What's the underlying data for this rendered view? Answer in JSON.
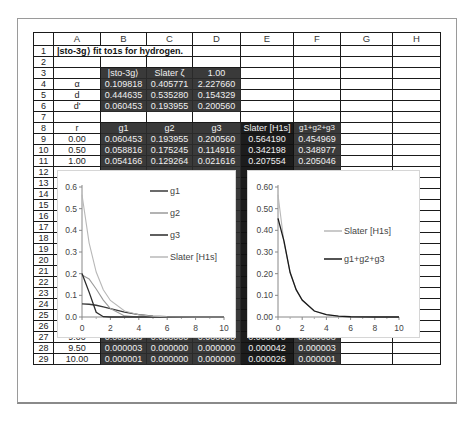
{
  "sheet": {
    "columns": [
      "A",
      "B",
      "C",
      "D",
      "E",
      "F",
      "G",
      "H"
    ],
    "title": "|sto-3g⟩ fit to1s for hydrogen.",
    "params_header": {
      "b": "|sto-3g⟩",
      "c": "Slater ζ",
      "d": "1.00"
    },
    "params": [
      {
        "label": "α",
        "b": "0.109818",
        "c": "0.405771",
        "d": "2.227660"
      },
      {
        "label": "d",
        "b": "0.444635",
        "c": "0.535280",
        "d": "0.154329"
      },
      {
        "label": "d'",
        "b": "0.060453",
        "c": "0.193955",
        "d": "0.200560"
      }
    ],
    "data_header": {
      "a": "r",
      "b": "g1",
      "c": "g2",
      "d": "g3",
      "e": "Slater [H1s]",
      "f": "g1+g2+g3"
    },
    "data_rows": [
      {
        "row": "9",
        "r": "0.00",
        "g1": "0.060453",
        "g2": "0.193955",
        "g3": "0.200560",
        "slater": "0.564190",
        "sum": "0.454969"
      },
      {
        "row": "10",
        "r": "0.50",
        "g1": "0.058816",
        "g2": "0.175245",
        "g3": "0.114916",
        "slater": "0.342198",
        "sum": "0.348977"
      },
      {
        "row": "11",
        "r": "1.00",
        "g1": "0.054166",
        "g2": "0.129264",
        "g3": "0.021616",
        "slater": "0.207554",
        "sum": "0.205046"
      },
      {
        "row": "25",
        "r": "8.00",
        "g1": "0.000054",
        "g2": "0.000000",
        "g3": "0.000000",
        "slater": "0.000189",
        "sum": "0.000054"
      },
      {
        "row": "26",
        "r": "8.50",
        "g1": "0.000022",
        "g2": "0.000000",
        "g3": "0.000000",
        "slater": "0.000115",
        "sum": "0.000022"
      },
      {
        "row": "27",
        "r": "9.00",
        "g1": "0.000008",
        "g2": "0.000000",
        "g3": "0.000000",
        "slater": "0.000070",
        "sum": "0.000008"
      },
      {
        "row": "28",
        "r": "9.50",
        "g1": "0.000003",
        "g2": "0.000000",
        "g3": "0.000000",
        "slater": "0.000042",
        "sum": "0.000003"
      },
      {
        "row": "29",
        "r": "10.00",
        "g1": "0.000001",
        "g2": "0.000000",
        "g3": "0.000000",
        "slater": "0.000026",
        "sum": "0.000001"
      }
    ],
    "row_numbers": [
      "1",
      "2",
      "3",
      "4",
      "5",
      "6",
      "7",
      "8",
      "9",
      "10",
      "11",
      "12",
      "13",
      "14",
      "15",
      "16",
      "17",
      "18",
      "19",
      "20",
      "21",
      "22",
      "23",
      "24",
      "25",
      "26",
      "27",
      "28",
      "29"
    ]
  },
  "chart_data": [
    {
      "type": "line",
      "title": "",
      "xlabel": "r [a.u.]",
      "ylabel": "",
      "xlim": [
        0,
        10
      ],
      "ylim": [
        0,
        0.6
      ],
      "x_ticks": [
        "0",
        "2",
        "4",
        "6",
        "8",
        "10"
      ],
      "y_ticks": [
        "0.0",
        "0.1",
        "0.2",
        "0.3",
        "0.4",
        "0.5",
        "0.6"
      ],
      "legend_position": "right",
      "x": [
        0,
        0.5,
        1,
        1.5,
        2,
        3,
        4,
        5,
        6,
        8,
        10
      ],
      "series": [
        {
          "name": "g1",
          "color": "#3a3a3a",
          "values": [
            0.0605,
            0.0588,
            0.0542,
            0.047,
            0.039,
            0.0225,
            0.0109,
            0.0039,
            0.0012,
            5e-05,
            1e-06
          ]
        },
        {
          "name": "g2",
          "color": "#9a9a9a",
          "values": [
            0.194,
            0.1752,
            0.1293,
            0.078,
            0.039,
            0.005,
            0.0003,
            0.0,
            0.0,
            0.0,
            0.0
          ]
        },
        {
          "name": "g3",
          "color": "#2a2a2a",
          "values": [
            0.2006,
            0.1149,
            0.0216,
            0.0013,
            0.0,
            0.0,
            0.0,
            0.0,
            0.0,
            0.0,
            0.0
          ]
        },
        {
          "name": "Slater [H1s]",
          "color": "#b8b8b8",
          "values": [
            0.5642,
            0.3422,
            0.2076,
            0.1259,
            0.0764,
            0.0281,
            0.0103,
            0.0038,
            0.0014,
            0.00019,
            2.6e-05
          ]
        }
      ]
    },
    {
      "type": "line",
      "title": "",
      "xlabel": "r [a.u.]",
      "ylabel": "",
      "xlim": [
        0,
        10
      ],
      "ylim": [
        0,
        0.6
      ],
      "x_ticks": [
        "0",
        "2",
        "4",
        "6",
        "8",
        "10"
      ],
      "y_ticks": [
        "0.00",
        "0.10",
        "0.20",
        "0.30",
        "0.40",
        "0.50",
        "0.60"
      ],
      "legend_position": "right",
      "x": [
        0,
        0.5,
        1,
        1.5,
        2,
        3,
        4,
        5,
        6,
        8,
        10
      ],
      "series": [
        {
          "name": "Slater [H1s]",
          "color": "#b8b8b8",
          "values": [
            0.5642,
            0.3422,
            0.2076,
            0.1259,
            0.0764,
            0.0281,
            0.0103,
            0.0038,
            0.0014,
            0.00019,
            2.6e-05
          ]
        },
        {
          "name": "g1+g2+g3",
          "color": "#1a1a1a",
          "values": [
            0.455,
            0.349,
            0.205,
            0.1263,
            0.078,
            0.0275,
            0.0112,
            0.0039,
            0.0012,
            5.4e-05,
            1e-06
          ]
        }
      ]
    }
  ]
}
